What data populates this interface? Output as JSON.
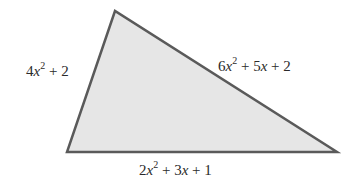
{
  "diagram": {
    "type": "triangle",
    "fill_color": "#e6e6e6",
    "stroke_color": "#5a5a5a",
    "vertices": {
      "top": [
        115,
        11
      ],
      "bottom_left": [
        67,
        152
      ],
      "bottom_right": [
        337,
        152
      ]
    },
    "sides": {
      "left": {
        "coef_sq": "4",
        "var": "x",
        "exp": "2",
        "rest": " + 2",
        "text": "4x^2 + 2"
      },
      "right": {
        "coef_sq": "6",
        "var": "x",
        "exp": "2",
        "mid": " + 5",
        "var2": "x",
        "rest": " + 2",
        "text": "6x^2 + 5x + 2"
      },
      "bottom": {
        "coef_sq": "2",
        "var": "x",
        "exp": "2",
        "mid": " + 3",
        "var2": "x",
        "rest": " + 1",
        "text": "2x^2 + 3x + 1"
      }
    }
  }
}
